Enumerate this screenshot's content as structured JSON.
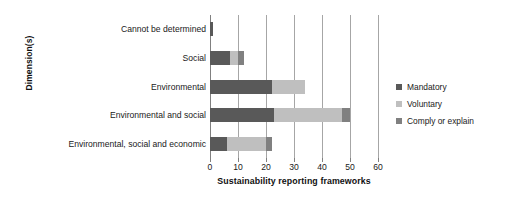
{
  "chart_data": {
    "type": "bar",
    "orientation": "horizontal",
    "stacked": true,
    "title": "",
    "xlabel": "Sustainability reporting frameworks",
    "ylabel": "Dimension(s)",
    "xlim": [
      0,
      60
    ],
    "xticks": [
      0,
      10,
      20,
      30,
      40,
      50,
      60
    ],
    "grid": true,
    "legend_position": "right",
    "categories": [
      "Cannot be determined",
      "Social",
      "Environmental",
      "Environmental and social",
      "Environmental, social and economic"
    ],
    "series": [
      {
        "name": "Mandatory",
        "color": "#595959",
        "values": [
          1,
          7,
          22,
          23,
          6
        ]
      },
      {
        "name": "Voluntary",
        "color": "#bfbfbf",
        "values": [
          0,
          3,
          12,
          24,
          14
        ]
      },
      {
        "name": "Comply or explain",
        "color": "#808080",
        "values": [
          0,
          2,
          0,
          3,
          2
        ]
      }
    ],
    "totals": [
      1,
      12,
      34,
      50,
      22
    ]
  },
  "legend": {
    "items": [
      {
        "label": "Mandatory"
      },
      {
        "label": "Voluntary"
      },
      {
        "label": "Comply or explain"
      }
    ]
  }
}
